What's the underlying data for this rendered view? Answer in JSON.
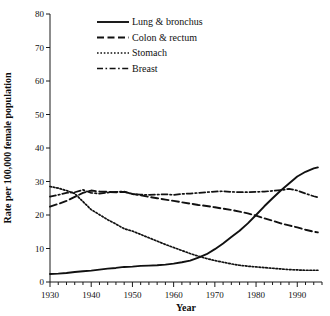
{
  "chart_data": {
    "type": "line",
    "title": "",
    "xlabel": "Year",
    "ylabel": "Rate per 100,000 female population",
    "xlim": [
      1930,
      1996
    ],
    "ylim": [
      0,
      80
    ],
    "grid": false,
    "legend_position": "top-center",
    "x_ticks": [
      1930,
      1940,
      1950,
      1960,
      1970,
      1980,
      1990
    ],
    "x_tick_labels": [
      "1930",
      "1940",
      "1950",
      "1960",
      "1970",
      "1980",
      "1990"
    ],
    "x_minor_tick_step": 2,
    "y_ticks": [
      0,
      10,
      20,
      30,
      40,
      50,
      60,
      70,
      80
    ],
    "y_tick_labels": [
      "0",
      "10",
      "20",
      "30",
      "40",
      "50",
      "60",
      "70",
      "80"
    ],
    "x": [
      1930,
      1932,
      1934,
      1936,
      1938,
      1940,
      1942,
      1944,
      1946,
      1948,
      1950,
      1952,
      1954,
      1956,
      1958,
      1960,
      1962,
      1964,
      1966,
      1968,
      1970,
      1972,
      1974,
      1976,
      1978,
      1980,
      1982,
      1984,
      1986,
      1988,
      1990,
      1992,
      1994,
      1995
    ],
    "series": [
      {
        "name": "Lung & bronchus",
        "style": "solid",
        "color": "#111111",
        "values": [
          2.4,
          2.5,
          2.7,
          3.0,
          3.2,
          3.4,
          3.7,
          4.0,
          4.2,
          4.5,
          4.6,
          4.8,
          4.9,
          5.0,
          5.2,
          5.5,
          5.9,
          6.4,
          7.3,
          8.3,
          9.8,
          11.5,
          13.4,
          15.3,
          17.5,
          20.0,
          22.6,
          25.0,
          27.3,
          29.4,
          31.5,
          32.9,
          33.9,
          34.2
        ]
      },
      {
        "name": "Colon & rectum",
        "style": "dashed",
        "color": "#111111",
        "values": [
          22.5,
          23.3,
          24.2,
          25.4,
          26.6,
          27.3,
          27.0,
          26.9,
          26.8,
          26.9,
          26.3,
          25.9,
          25.4,
          25.0,
          24.6,
          24.2,
          23.8,
          23.4,
          23.0,
          22.7,
          22.3,
          21.9,
          21.5,
          21.0,
          20.5,
          19.8,
          19.0,
          18.3,
          17.5,
          16.9,
          16.3,
          15.6,
          15.0,
          14.8
        ]
      },
      {
        "name": "Stomach",
        "style": "dotted",
        "color": "#111111",
        "values": [
          28.5,
          28.0,
          27.3,
          26.4,
          24.0,
          21.6,
          20.1,
          18.6,
          17.3,
          15.9,
          15.2,
          14.2,
          13.2,
          12.2,
          11.2,
          10.3,
          9.4,
          8.5,
          7.7,
          7.0,
          6.4,
          5.9,
          5.4,
          5.0,
          4.7,
          4.5,
          4.3,
          4.1,
          3.9,
          3.7,
          3.6,
          3.5,
          3.5,
          3.5
        ]
      },
      {
        "name": "Breast",
        "style": "dashdot",
        "color": "#111111",
        "values": [
          25.5,
          26.0,
          26.6,
          26.8,
          27.5,
          26.6,
          26.4,
          26.7,
          26.9,
          27.0,
          26.2,
          26.1,
          26.0,
          26.1,
          26.2,
          26.0,
          26.3,
          26.4,
          26.6,
          26.8,
          27.0,
          27.1,
          26.9,
          26.8,
          26.8,
          26.9,
          27.0,
          27.2,
          27.4,
          27.8,
          27.3,
          26.4,
          25.6,
          25.3
        ]
      }
    ]
  },
  "legend": {
    "entries": [
      {
        "label": "Lung & bronchus",
        "style": "solid"
      },
      {
        "label": "Colon & rectum",
        "style": "dashed"
      },
      {
        "label": "Stomach",
        "style": "dotted"
      },
      {
        "label": "Breast",
        "style": "dashdot"
      }
    ]
  }
}
